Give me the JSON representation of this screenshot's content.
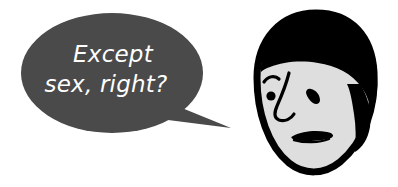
{
  "image": {
    "type": "cartoon-illustration",
    "width": 398,
    "height": 187,
    "background_color": "#ffffff",
    "description": "Comic panel with a speech balloon at left and a cartoon man's head at right"
  },
  "speech_bubble": {
    "shape": "ellipse-with-tail",
    "fill_color": "#4a4a4a",
    "text_color": "#ffffff",
    "tail_direction": "down-right",
    "lines": [
      "Except",
      "sex, right?"
    ],
    "full_text": "Except sex, right?"
  },
  "character": {
    "name": "cartoon-man-head",
    "facing": "three-quarter-left",
    "expression": "skeptical",
    "colors": {
      "hair": "#000000",
      "skin": "#dedede",
      "outline": "#000000"
    },
    "features": [
      {
        "name": "hair",
        "label": "Black swept hair"
      },
      {
        "name": "left-eyebrow",
        "label": "Raised curved eyebrow"
      },
      {
        "name": "left-eye",
        "label": "Round pupil dot"
      },
      {
        "name": "right-eye",
        "label": "Squinting wedge eye"
      },
      {
        "name": "nose",
        "label": "Hooked curved nose"
      },
      {
        "name": "mouth",
        "label": "Flat wedge frown"
      },
      {
        "name": "ear",
        "label": "Right ear"
      }
    ]
  }
}
